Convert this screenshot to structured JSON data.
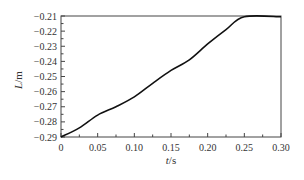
{
  "chart_data": {
    "type": "line",
    "title": "",
    "xlabel": "t/s",
    "ylabel": "L/m",
    "xlim": [
      0,
      0.3
    ],
    "ylim": [
      -0.29,
      -0.21
    ],
    "grid": false,
    "legend": null,
    "x_ticks": [
      "0",
      "0.05",
      "0.10",
      "0.15",
      "0.20",
      "0.25",
      "0.30"
    ],
    "y_ticks": [
      "-0.21",
      "-0.22",
      "-0.23",
      "-0.24",
      "-0.25",
      "-0.26",
      "-0.27",
      "-0.28",
      "-0.29"
    ],
    "series": [
      {
        "name": "L",
        "color": "#111111",
        "x": [
          0,
          0.025,
          0.05,
          0.075,
          0.1,
          0.125,
          0.15,
          0.175,
          0.2,
          0.225,
          0.25,
          0.3
        ],
        "values": [
          -0.29,
          -0.284,
          -0.2755,
          -0.27,
          -0.2635,
          -0.2545,
          -0.246,
          -0.239,
          -0.2285,
          -0.219,
          -0.2105,
          -0.2105
        ]
      }
    ]
  },
  "labels": {
    "xlabel_var": "t",
    "xlabel_unit": "/s",
    "ylabel_var": "L",
    "ylabel_unit": "/m"
  }
}
